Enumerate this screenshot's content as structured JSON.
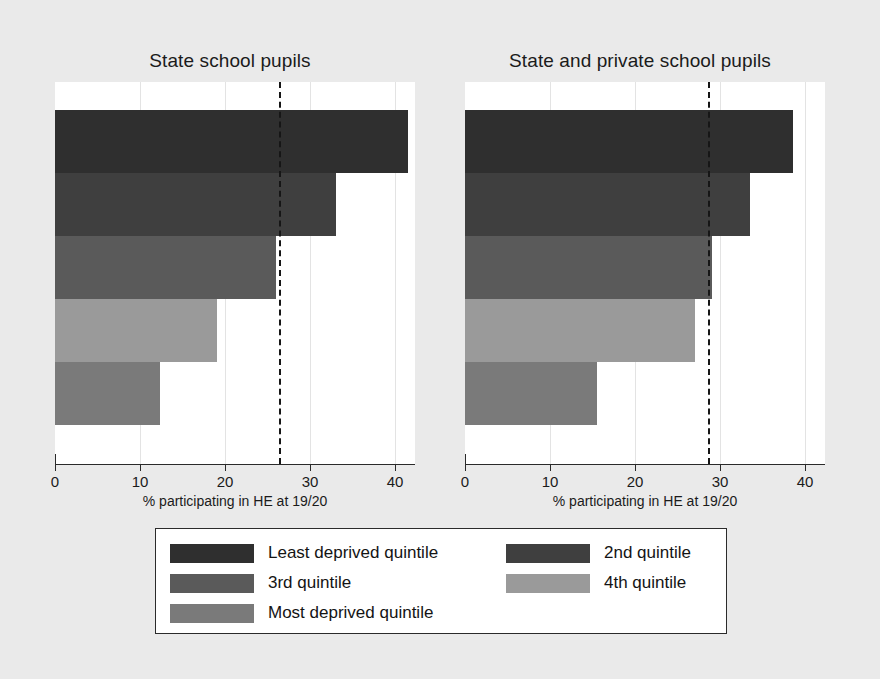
{
  "chart_data": {
    "type": "bar",
    "orientation": "horizontal",
    "title": "",
    "xlabel": "% participating in HE at 19/20",
    "ylabel": "",
    "xlim": [
      0,
      43
    ],
    "xticks": [
      0,
      10,
      20,
      30,
      40
    ],
    "xticklabels": [
      "0",
      "10",
      "20",
      "30",
      "40"
    ],
    "grid": true,
    "legend_position": "bottom",
    "categories": [
      "Least deprived quintile",
      "2nd quintile",
      "3rd quintile",
      "4th quintile",
      "Most deprived quintile"
    ],
    "colors": [
      "#2f2f2f",
      "#3f3f3f",
      "#5a5a5a",
      "#9a9a9a",
      "#7a7a7a"
    ],
    "panels": [
      {
        "title": "State school pupils",
        "values": [
          41.5,
          33.0,
          26.0,
          19.0,
          12.3
        ],
        "reference_line": 26.4
      },
      {
        "title": "State and private school pupils",
        "values": [
          38.6,
          33.5,
          29.0,
          27.0,
          15.5
        ],
        "reference_line": 28.6
      }
    ]
  },
  "figure": {
    "background": "#eaeaea",
    "plot_background": "#ffffff",
    "axis_color": "#2a2a2a"
  },
  "panel_left": {
    "title": "State school pupils",
    "xlabel": "% participating in HE at 19/20",
    "ticks": [
      "0",
      "10",
      "20",
      "30",
      "40"
    ],
    "bars": [
      {
        "label": "Least deprived quintile",
        "value": 41.5,
        "color": "#2f2f2f"
      },
      {
        "label": "2nd quintile",
        "value": 33.0,
        "color": "#3f3f3f"
      },
      {
        "label": "3rd quintile",
        "value": 26.0,
        "color": "#5a5a5a"
      },
      {
        "label": "4th quintile",
        "value": 19.0,
        "color": "#9a9a9a"
      },
      {
        "label": "Most deprived quintile",
        "value": 12.3,
        "color": "#7a7a7a"
      }
    ],
    "reference_line": 26.4
  },
  "panel_right": {
    "title": "State and private school pupils",
    "xlabel": "% participating in HE at 19/20",
    "ticks": [
      "0",
      "10",
      "20",
      "30",
      "40"
    ],
    "bars": [
      {
        "label": "Least deprived quintile",
        "value": 38.6,
        "color": "#2f2f2f"
      },
      {
        "label": "2nd quintile",
        "value": 33.5,
        "color": "#3f3f3f"
      },
      {
        "label": "3rd quintile",
        "value": 29.0,
        "color": "#5a5a5a"
      },
      {
        "label": "4th quintile",
        "value": 27.0,
        "color": "#9a9a9a"
      },
      {
        "label": "Most deprived quintile",
        "value": 15.5,
        "color": "#7a7a7a"
      }
    ],
    "reference_line": 28.6
  },
  "legend": {
    "column1": [
      {
        "label": "Least deprived quintile",
        "color": "#2f2f2f"
      },
      {
        "label": "3rd quintile",
        "color": "#5a5a5a"
      },
      {
        "label": "Most deprived quintile",
        "color": "#7a7a7a"
      }
    ],
    "column2": [
      {
        "label": "2nd quintile",
        "color": "#3f3f3f"
      },
      {
        "label": "4th quintile",
        "color": "#9a9a9a"
      }
    ]
  }
}
